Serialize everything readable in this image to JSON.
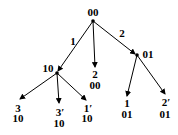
{
  "diagram": {
    "type": "tree",
    "root": {
      "id": "n00",
      "label": "00",
      "x": 93,
      "y": 21,
      "label_x": 93,
      "label_y": 15
    },
    "internal_nodes": [
      {
        "id": "n10",
        "label": "10",
        "x": 57,
        "y": 73,
        "label_x": 47,
        "label_y": 72
      },
      {
        "id": "n01",
        "label": "01",
        "x": 137,
        "y": 55,
        "label_x": 147,
        "label_y": 57
      }
    ],
    "leaves": [
      {
        "id": "leafA",
        "top": "2",
        "bottom": "00",
        "x": 95,
        "y": 68
      },
      {
        "id": "leafB",
        "top": "3",
        "bottom": "10",
        "x": 20,
        "y": 99
      },
      {
        "id": "leafC",
        "top": "3′",
        "bottom": "10",
        "x": 59,
        "y": 103
      },
      {
        "id": "leafD",
        "top": "1′",
        "bottom": "10",
        "x": 86,
        "y": 100
      },
      {
        "id": "leafE",
        "top": "1",
        "bottom": "01",
        "x": 127,
        "y": 96
      },
      {
        "id": "leafF",
        "top": "2′",
        "bottom": "01",
        "x": 165,
        "y": 94
      }
    ],
    "edge_labels": [
      {
        "text": "1",
        "x": 73,
        "y": 45
      },
      {
        "text": "2",
        "x": 122,
        "y": 36
      }
    ]
  }
}
